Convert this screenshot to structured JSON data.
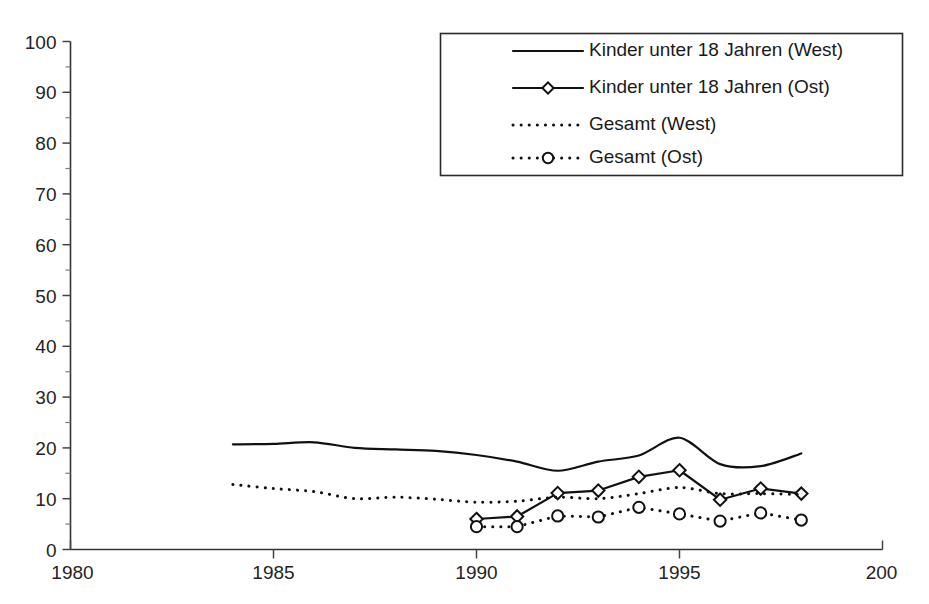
{
  "chart_data": {
    "type": "line",
    "title": "",
    "xlabel": "",
    "ylabel": "",
    "xlim": [
      1980,
      2000
    ],
    "ylim": [
      0,
      100
    ],
    "x_ticks": [
      "1980",
      "1985",
      "1990",
      "1995",
      "200"
    ],
    "x_tick_values": [
      1980,
      1985,
      1990,
      1995,
      2000
    ],
    "y_ticks": [
      "0",
      "10",
      "20",
      "30",
      "40",
      "50",
      "60",
      "70",
      "80",
      "90",
      "100"
    ],
    "y_tick_values": [
      0,
      10,
      20,
      30,
      40,
      50,
      60,
      70,
      80,
      90,
      100
    ],
    "y_minor_tick_values": [
      5,
      15,
      25,
      35,
      45,
      55,
      65,
      75,
      85,
      95
    ],
    "grid": false,
    "legend_position": "top-right",
    "series": [
      {
        "name": "Kinder unter 18 Jahren (West)",
        "style": "solid",
        "marker": "none",
        "x": [
          1984,
          1985,
          1986,
          1987,
          1988,
          1989,
          1990,
          1991,
          1992,
          1993,
          1994,
          1995,
          1996,
          1997,
          1998
        ],
        "values": [
          20.7,
          20.8,
          21.1,
          20.0,
          19.7,
          19.4,
          18.6,
          17.3,
          15.5,
          17.3,
          18.5,
          22.0,
          16.8,
          16.4,
          18.9
        ]
      },
      {
        "name": "Kinder unter 18 Jahren (Ost)",
        "style": "solid",
        "marker": "diamond",
        "x": [
          1990,
          1991,
          1992,
          1993,
          1994,
          1995,
          1996,
          1997,
          1998
        ],
        "values": [
          6.0,
          6.5,
          11.1,
          11.6,
          14.3,
          15.6,
          9.8,
          12.0,
          11.0
        ]
      },
      {
        "name": "Gesamt (West)",
        "style": "dotted",
        "marker": "none",
        "x": [
          1984,
          1985,
          1986,
          1987,
          1988,
          1989,
          1990,
          1991,
          1992,
          1993,
          1994,
          1995,
          1996,
          1997,
          1998
        ],
        "values": [
          12.8,
          12.0,
          11.4,
          10.0,
          10.3,
          9.9,
          9.3,
          9.5,
          10.3,
          10.0,
          11.0,
          12.2,
          11.0,
          11.0,
          10.8
        ]
      },
      {
        "name": "Gesamt (Ost)",
        "style": "dotted",
        "marker": "circle",
        "x": [
          1990,
          1991,
          1992,
          1993,
          1994,
          1995,
          1996,
          1997,
          1998
        ],
        "values": [
          4.5,
          4.5,
          6.6,
          6.4,
          8.3,
          7.0,
          5.6,
          7.2,
          5.8
        ]
      }
    ]
  },
  "legend": {
    "items": [
      {
        "label": "Kinder unter 18 Jahren (West)",
        "style": "solid",
        "marker": "none"
      },
      {
        "label": "Kinder unter 18 Jahren (Ost)",
        "style": "solid",
        "marker": "diamond"
      },
      {
        "label": "Gesamt (West)",
        "style": "dotted",
        "marker": "none"
      },
      {
        "label": "Gesamt (Ost)",
        "style": "dotted",
        "marker": "circle"
      }
    ]
  },
  "colors": {
    "line": "#111111",
    "axis": "#333333",
    "text": "#1a1a1a",
    "background": "#ffffff"
  }
}
